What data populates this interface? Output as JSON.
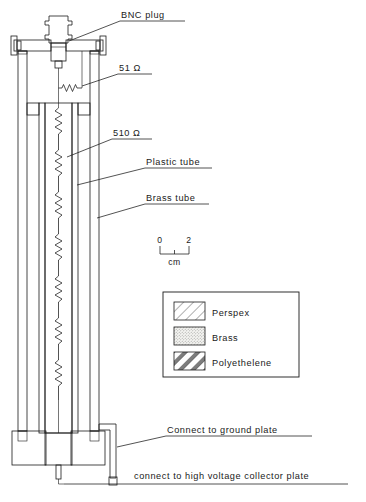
{
  "figure": {
    "background_color": "#ffffff",
    "line_color": "#1a1a1a"
  },
  "callouts": {
    "bnc_plug": "BNC  plug",
    "resistor_51": "51 Ω",
    "resistor_510": "510 Ω",
    "plastic_tube": "Plastic  tube",
    "brass_tube": "Brass  tube",
    "ground_plate": "Connect to ground plate",
    "collector_plate": "connect to high voltage collector plate"
  },
  "scale_bar": {
    "start_label": "0",
    "end_label": "2",
    "unit_label": "cm",
    "ticks": [
      "0",
      "1",
      "2"
    ]
  },
  "legend": {
    "items": [
      {
        "label": "Perspex",
        "pattern": "diagonal-hatch"
      },
      {
        "label": "Brass",
        "pattern": "stipple-dots"
      },
      {
        "label": "Polyethelene",
        "pattern": "thick-diagonal-stripes"
      }
    ]
  },
  "materials": {
    "perspex": {
      "name": "Perspex",
      "hatch": "thin diagonal lines"
    },
    "brass": {
      "name": "Brass",
      "hatch": "fine stipple"
    },
    "polyethelene": {
      "name": "Polyethelene",
      "hatch": "bold diagonal bands"
    }
  },
  "components": [
    {
      "name": "bnc-plug",
      "label": "BNC plug"
    },
    {
      "name": "top-flange-plate",
      "label": "Brass flange plate"
    },
    {
      "name": "flange-bolt-left",
      "label": "Bolt"
    },
    {
      "name": "flange-bolt-right",
      "label": "Bolt"
    },
    {
      "name": "resistor-51-ohm",
      "label": "51 Ω"
    },
    {
      "name": "resistor-510-ohm",
      "label": "510 Ω"
    },
    {
      "name": "outer-brass-tube",
      "label": "Brass tube"
    },
    {
      "name": "inner-plastic-tube",
      "label": "Plastic tube"
    },
    {
      "name": "perspex-base-block-left",
      "label": "Perspex base"
    },
    {
      "name": "perspex-base-block-right",
      "label": "Perspex base"
    },
    {
      "name": "ground-terminal",
      "label": "Ground terminal"
    },
    {
      "name": "collector-terminal",
      "label": "Collector terminal"
    }
  ]
}
